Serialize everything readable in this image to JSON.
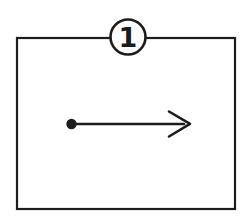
{
  "diagram": {
    "callout": {
      "label": "1"
    },
    "arrow": {
      "direction": "right",
      "origin_marker": "filled-dot",
      "terminator": "open-arrowhead"
    },
    "frame": {
      "shape": "rectangle"
    }
  },
  "colors": {
    "line": "#1c1c1c",
    "background": "#ffffff"
  }
}
